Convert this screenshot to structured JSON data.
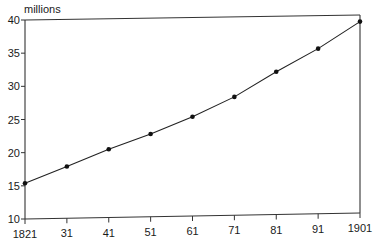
{
  "chart_data": {
    "type": "line",
    "title": "",
    "xlabel": "",
    "ylabel": "millions",
    "x": [
      1821,
      1831,
      1841,
      1851,
      1861,
      1871,
      1881,
      1891,
      1901
    ],
    "x_tick_labels": [
      "1821",
      "31",
      "41",
      "51",
      "61",
      "71",
      "81",
      "91",
      "1901"
    ],
    "series": [
      {
        "name": "Population",
        "values": [
          15.4,
          17.8,
          20.3,
          22.5,
          25.0,
          27.9,
          31.6,
          35.0,
          39.0
        ]
      }
    ],
    "y_ticks": [
      10,
      15,
      20,
      25,
      30,
      35,
      40
    ],
    "ylim": [
      10,
      40
    ],
    "xlim": [
      1821,
      1901
    ],
    "grid": false,
    "legend": "none",
    "frame": "box",
    "colors": {
      "line": "#222222",
      "marker": "#111111",
      "axis": "#333333"
    }
  }
}
